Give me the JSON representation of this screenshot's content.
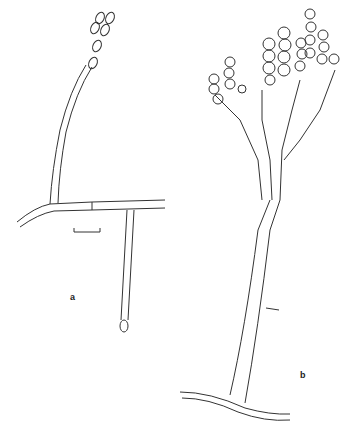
{
  "figure": {
    "panels": [
      {
        "id": "a",
        "label": "a",
        "description": "hypha with two simple conidiophores, one bearing a cluster of ellipsoidal conidia; scale bar"
      },
      {
        "id": "b",
        "label": "b",
        "description": "branched penicillate conidiophore with chains of globose conidia arising from a hypha"
      }
    ],
    "line_color": "#333333",
    "background": "#ffffff"
  }
}
